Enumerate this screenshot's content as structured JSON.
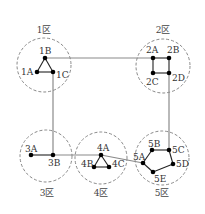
{
  "zones": [
    {
      "id": "1",
      "label": "1区",
      "cx": 44,
      "cy": 65,
      "r": 27,
      "lx": 44,
      "ly": 33
    },
    {
      "id": "2",
      "label": "2区",
      "cx": 163,
      "cy": 66,
      "r": 27,
      "lx": 163,
      "ly": 33
    },
    {
      "id": "3",
      "label": "3区",
      "cx": 46,
      "cy": 156,
      "r": 26,
      "lx": 47,
      "ly": 196
    },
    {
      "id": "4",
      "label": "4区",
      "cx": 101,
      "cy": 158,
      "r": 26,
      "lx": 101,
      "ly": 196
    },
    {
      "id": "5",
      "label": "5区",
      "cx": 162,
      "cy": 158,
      "r": 27,
      "lx": 162,
      "ly": 196
    }
  ],
  "nodes": [
    {
      "id": "1A",
      "label": "1A",
      "x": 37,
      "y": 72,
      "lx": 21,
      "ly": 75
    },
    {
      "id": "1B",
      "label": "1B",
      "x": 45,
      "y": 58,
      "lx": 39,
      "ly": 54
    },
    {
      "id": "1C",
      "label": "1C",
      "x": 53,
      "y": 72,
      "lx": 56,
      "ly": 78
    },
    {
      "id": "2A",
      "label": "2A",
      "x": 153,
      "y": 58,
      "lx": 146,
      "ly": 53
    },
    {
      "id": "2B",
      "label": "2B",
      "x": 169,
      "y": 58,
      "lx": 167,
      "ly": 53
    },
    {
      "id": "2C",
      "label": "2C",
      "x": 153,
      "y": 73,
      "lx": 146,
      "ly": 85
    },
    {
      "id": "2D",
      "label": "2D",
      "x": 169,
      "y": 73,
      "lx": 172,
      "ly": 81
    },
    {
      "id": "3A",
      "label": "3A",
      "x": 31,
      "y": 155,
      "lx": 25,
      "ly": 152
    },
    {
      "id": "3B",
      "label": "3B",
      "x": 53,
      "y": 155,
      "lx": 48,
      "ly": 166
    },
    {
      "id": "4A",
      "label": "4A",
      "x": 101,
      "y": 155,
      "lx": 97,
      "ly": 151
    },
    {
      "id": "4B",
      "label": "4B",
      "x": 94,
      "y": 167,
      "lx": 81,
      "ly": 167
    },
    {
      "id": "4C",
      "label": "4C",
      "x": 109,
      "y": 167,
      "lx": 112,
      "ly": 167
    },
    {
      "id": "5A",
      "label": "5A",
      "x": 143,
      "y": 163,
      "lx": 133,
      "ly": 160
    },
    {
      "id": "5B",
      "label": "5B",
      "x": 152,
      "y": 150,
      "lx": 148,
      "ly": 147
    },
    {
      "id": "5C",
      "label": "5C",
      "x": 169,
      "y": 150,
      "lx": 172,
      "ly": 153
    },
    {
      "id": "5D",
      "label": "5D",
      "x": 173,
      "y": 164,
      "lx": 176,
      "ly": 167
    },
    {
      "id": "5E",
      "label": "5E",
      "x": 153,
      "y": 172,
      "lx": 154,
      "ly": 182
    }
  ],
  "intra_edges": [
    [
      "1A",
      "1B"
    ],
    [
      "1B",
      "1C"
    ],
    [
      "1A",
      "1C"
    ],
    [
      "2A",
      "2B"
    ],
    [
      "2A",
      "2C"
    ],
    [
      "2C",
      "2D"
    ],
    [
      "2B",
      "2D"
    ],
    [
      "3A",
      "3B"
    ],
    [
      "4A",
      "4B"
    ],
    [
      "4B",
      "4C"
    ],
    [
      "4A",
      "4C"
    ],
    [
      "5A",
      "5B"
    ],
    [
      "5B",
      "5C"
    ],
    [
      "5C",
      "5D"
    ],
    [
      "5D",
      "5E"
    ],
    [
      "5E",
      "5A"
    ]
  ],
  "inter_links": [
    {
      "from": "1B",
      "to": "2A",
      "points": [
        [
          45,
          58
        ],
        [
          153,
          58
        ]
      ]
    },
    {
      "from": "1C",
      "to": "3B",
      "points": [
        [
          53,
          72
        ],
        [
          53,
          155
        ]
      ]
    },
    {
      "from": "2D",
      "to": "5C",
      "points": [
        [
          169,
          73
        ],
        [
          169,
          150
        ]
      ]
    },
    {
      "from": "3B",
      "to": "4A",
      "points": [
        [
          53,
          155
        ],
        [
          101,
          155
        ]
      ]
    },
    {
      "from": "4A",
      "to": "5A",
      "points": [
        [
          101,
          155
        ],
        [
          143,
          163
        ]
      ]
    }
  ]
}
